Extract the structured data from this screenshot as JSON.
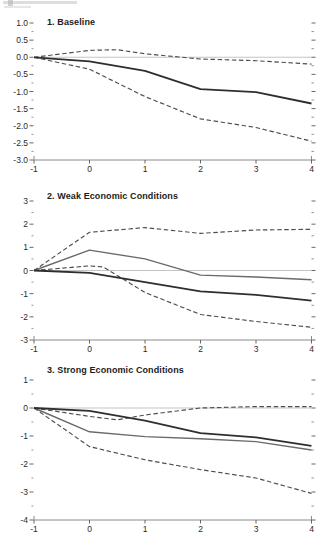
{
  "figure": {
    "background": "#ffffff"
  },
  "colors": {
    "solid_dark": "#2e2e2e",
    "solid_light": "#6a6a6a",
    "dashed": "#4d4d4d",
    "zero_line": "#bdbdbd",
    "axis": "#8a8a8a",
    "tick": "#555555",
    "tick_label": "#2a2a2a"
  },
  "chart_data": [
    {
      "type": "line",
      "title": "1. Baseline",
      "xlim": [
        -1,
        4
      ],
      "ylim": [
        -3,
        1
      ],
      "xticks": {
        "values": [
          -1,
          0,
          1,
          2,
          3,
          4
        ],
        "labels": [
          "-1",
          "0",
          "1",
          "2",
          "3",
          "4"
        ]
      },
      "yticks": {
        "values": [
          1.0,
          0.5,
          0.0,
          -0.5,
          -1.0,
          -1.5,
          -2.0,
          -2.5,
          -3.0
        ],
        "labels": [
          "1.0",
          "0.5",
          "0.0",
          "-0.5",
          "-1.0",
          "-1.5",
          "-2.0",
          "-2.5",
          "-3.0"
        ]
      },
      "yminor_step": 0.25,
      "zero_line": true,
      "grid": false,
      "legend": "none",
      "series": [
        {
          "name": "upper_confidence_band",
          "style": "dashed",
          "x": [
            -1,
            0,
            0.5,
            1,
            2,
            3,
            4
          ],
          "values": [
            0,
            0.2,
            0.22,
            0.1,
            -0.05,
            -0.1,
            -0.2
          ]
        },
        {
          "name": "lower_confidence_band",
          "style": "dashed",
          "x": [
            -1,
            0,
            1,
            2,
            3,
            4
          ],
          "values": [
            0,
            -0.35,
            -1.15,
            -1.8,
            -2.05,
            -2.45
          ]
        },
        {
          "name": "point_estimate",
          "style": "solid_dark",
          "x": [
            -1,
            0,
            1,
            2,
            3,
            4
          ],
          "values": [
            0,
            -0.12,
            -0.4,
            -0.93,
            -1.02,
            -1.35
          ]
        }
      ]
    },
    {
      "type": "line",
      "title": "2. Weak Economic Conditions",
      "xlim": [
        -1,
        4
      ],
      "ylim": [
        -3,
        3
      ],
      "xticks": {
        "values": [
          -1,
          0,
          1,
          2,
          3,
          4
        ],
        "labels": [
          "-1",
          "0",
          "1",
          "2",
          "3",
          "4"
        ]
      },
      "yticks": {
        "values": [
          3,
          2,
          1,
          0,
          -1,
          -2,
          -3
        ],
        "labels": [
          "3",
          "2",
          "1",
          "0",
          "-1",
          "-2",
          "-3"
        ]
      },
      "yminor_step": 0.5,
      "zero_line": true,
      "grid": false,
      "legend": "none",
      "series": [
        {
          "name": "upper_confidence_band",
          "style": "dashed",
          "x": [
            -1,
            0,
            1,
            2,
            3,
            4
          ],
          "values": [
            0,
            1.65,
            1.85,
            1.6,
            1.75,
            1.78
          ]
        },
        {
          "name": "lower_confidence_band",
          "style": "dashed",
          "x": [
            -1,
            0,
            0.25,
            1,
            2,
            3,
            4
          ],
          "values": [
            0,
            0.2,
            0.15,
            -0.95,
            -1.9,
            -2.2,
            -2.45
          ]
        },
        {
          "name": "weak_conditions_response",
          "style": "solid_light",
          "x": [
            -1,
            0,
            1,
            2,
            3,
            4
          ],
          "values": [
            0,
            0.88,
            0.5,
            -0.2,
            -0.28,
            -0.4
          ]
        },
        {
          "name": "baseline_overlay",
          "style": "solid_dark",
          "x": [
            -1,
            0,
            1,
            2,
            3,
            4
          ],
          "values": [
            0,
            -0.1,
            -0.5,
            -0.9,
            -1.05,
            -1.3
          ]
        }
      ]
    },
    {
      "type": "line",
      "title": "3. Strong Economic Conditions",
      "xlim": [
        -1,
        4
      ],
      "ylim": [
        -4,
        1
      ],
      "xticks": {
        "values": [
          -1,
          0,
          1,
          2,
          3,
          4
        ],
        "labels": [
          "-1",
          "0",
          "1",
          "2",
          "3",
          "4"
        ]
      },
      "yticks": {
        "values": [
          1,
          0,
          -1,
          -2,
          -3,
          -4
        ],
        "labels": [
          "1",
          "0",
          "-1",
          "-2",
          "-3",
          "-4"
        ]
      },
      "yminor_step": 0.5,
      "zero_line": true,
      "grid": false,
      "legend": "none",
      "series": [
        {
          "name": "upper_confidence_band",
          "style": "dashed",
          "x": [
            -1,
            0,
            0.5,
            1,
            2,
            3,
            4
          ],
          "values": [
            0,
            -0.3,
            -0.42,
            -0.25,
            0.0,
            0.05,
            0.05
          ]
        },
        {
          "name": "lower_confidence_band",
          "style": "dashed",
          "x": [
            -1,
            0,
            1,
            2,
            3,
            4
          ],
          "values": [
            0,
            -1.38,
            -1.85,
            -2.2,
            -2.5,
            -3.05
          ]
        },
        {
          "name": "strong_conditions_response",
          "style": "solid_light",
          "x": [
            -1,
            0,
            1,
            2,
            3,
            4
          ],
          "values": [
            0,
            -0.85,
            -1.02,
            -1.1,
            -1.2,
            -1.5
          ]
        },
        {
          "name": "baseline_overlay",
          "style": "solid_dark",
          "x": [
            -1,
            0,
            1,
            2,
            3,
            4
          ],
          "values": [
            0,
            -0.1,
            -0.45,
            -0.9,
            -1.05,
            -1.35
          ]
        }
      ]
    }
  ]
}
